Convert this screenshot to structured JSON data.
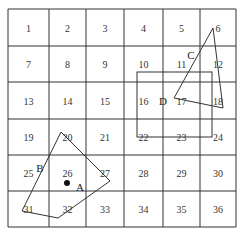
{
  "diagram": {
    "title": "",
    "grid": {
      "rows": 6,
      "cols": 6,
      "x_lines": [
        8,
        49,
        86,
        124,
        163,
        200,
        236
      ],
      "y_lines": [
        9,
        46,
        82,
        119,
        155,
        191,
        227
      ],
      "line_color": "#333333"
    },
    "cells": [
      "1",
      "2",
      "3",
      "4",
      "5",
      "6",
      "7",
      "8",
      "9",
      "10",
      "11",
      "12",
      "13",
      "14",
      "15",
      "16",
      "17",
      "18",
      "19",
      "20",
      "21",
      "22",
      "23",
      "24",
      "25",
      "26",
      "27",
      "28",
      "29",
      "30",
      "31",
      "32",
      "33",
      "34",
      "35",
      "36"
    ],
    "shapes": {
      "rect_D": {
        "label": "D",
        "x1": 137,
        "y1": 72,
        "x2": 212,
        "y2": 137
      },
      "triangle_C": {
        "label": "C",
        "points": [
          [
            213,
            28
          ],
          [
            174,
            98
          ],
          [
            223,
            108
          ]
        ]
      },
      "polygon_B": {
        "label": "B",
        "points": [
          [
            61,
            132
          ],
          [
            110,
            181
          ],
          [
            58,
            218
          ],
          [
            22,
            211
          ]
        ]
      },
      "point_A": {
        "label": "A",
        "x": 67,
        "y": 183
      }
    },
    "labels": {
      "A": "A",
      "B": "B",
      "C": "C",
      "D": "D"
    }
  }
}
